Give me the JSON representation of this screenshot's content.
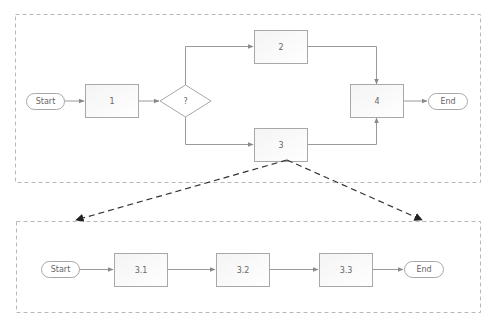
{
  "colors": {
    "frame_stroke": "#b8b8b8",
    "node_stroke": "#a8a8a8",
    "connector": "#9a9a9a",
    "zoom_connector": "#333333",
    "label": "#666666",
    "background": "#ffffff"
  },
  "top_process": {
    "start_label": "Start",
    "step1_label": "1",
    "decision_label": "?",
    "step2_label": "2",
    "step3_label": "3",
    "step4_label": "4",
    "end_label": "End"
  },
  "sub_process": {
    "start_label": "Start",
    "step31_label": "3.1",
    "step32_label": "3.2",
    "step33_label": "3.3",
    "end_label": "End"
  }
}
